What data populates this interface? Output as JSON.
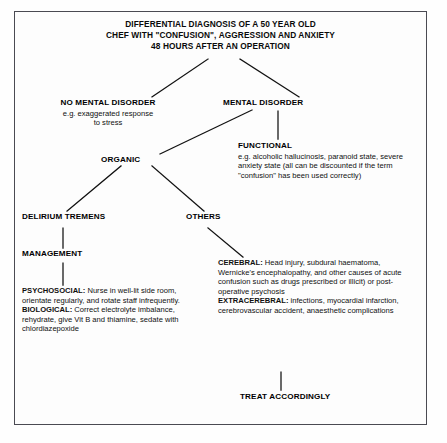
{
  "document": {
    "kind": "clinical-flowchart",
    "title_lines": [
      "DIFFERENTIAL DIAGNOSIS OF A 50 YEAR OLD",
      "CHEF WITH \"CONFUSION\", AGGRESSION AND ANXIETY",
      "48 HOURS AFTER AN OPERATION"
    ],
    "frame_color": "#4a4a52",
    "text_color": "#0a0a0a",
    "background": "#ffffff"
  },
  "nodes": {
    "no_mental_disorder": {
      "heading": "NO MENTAL DISORDER",
      "detail_line1": "e.g. exaggerated response",
      "detail_line2": "to stress"
    },
    "mental_disorder": {
      "heading": "MENTAL DISORDER"
    },
    "functional": {
      "heading": "FUNCTIONAL",
      "detail": "e.g. alcoholic hallucinosis, paranoid state, severe anxiety state (all can be discounted if the term \"confusion\" has been used correctly)"
    },
    "organic": {
      "heading": "ORGANIC"
    },
    "delirium_tremens": {
      "heading": "DELIRIUM TREMENS"
    },
    "others": {
      "heading": "OTHERS"
    },
    "management": {
      "heading": "MANAGEMENT",
      "psychosocial_label": "PSYCHOSOCIAL:",
      "psychosocial_text": " Nurse in well-lit side room, orientate regularly, and rotate staff infrequently.",
      "biological_label": "BIOLOGICAL:",
      "biological_text": " Correct electrolyte imbalance, rehydrate, give Vit B and thiamine, sedate with chlordiazepoxide"
    },
    "others_detail": {
      "cerebral_label": "CEREBRAL:",
      "cerebral_text": " Head injury, subdural haematoma, Wernicke's encephalopathy, and other causes of acute confusion such as drugs prescribed or illicit) or post-operative psychosis",
      "extracerebral_label": "EXTRACEREBRAL:",
      "extracerebral_text": " infections, myocardial infarction, cerebrovascular accident, anaesthetic complications"
    },
    "treat_accordingly": {
      "heading": "TREAT ACCORDINGLY"
    }
  }
}
